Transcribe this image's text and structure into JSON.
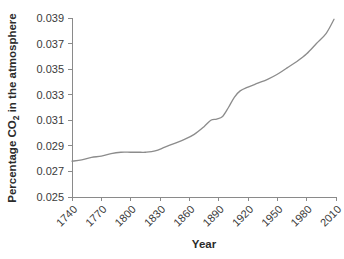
{
  "chart_data": {
    "type": "line",
    "title": "",
    "xlabel": "Year",
    "ylabel": "Percentage CO2 in the atmosphere",
    "ylabel_parts": {
      "prefix": "Percentage CO",
      "subscript": "2",
      "suffix": " in the atmosphere"
    },
    "xlim": [
      1740,
      2010
    ],
    "ylim": [
      0.025,
      0.039
    ],
    "xticks": [
      1740,
      1770,
      1800,
      1830,
      1860,
      1890,
      1920,
      1950,
      1980,
      2010
    ],
    "xtick_labels": [
      "1740",
      "1770",
      "1800",
      "1830",
      "1860",
      "1890",
      "1920",
      "1950",
      "1980",
      "2010"
    ],
    "yticks": [
      0.025,
      0.027,
      0.029,
      0.031,
      0.033,
      0.035,
      0.037,
      0.039
    ],
    "ytick_labels": [
      "0.025",
      "0.027",
      "0.029",
      "0.031",
      "0.033",
      "0.035",
      "0.037",
      "0.039"
    ],
    "grid": false,
    "legend": false,
    "xtick_label_rotation": -45,
    "line_color": "#8c8c8c",
    "axis_color": "#8a8a8a",
    "series": [
      {
        "name": "Atmospheric CO2",
        "x": [
          1740,
          1750,
          1760,
          1770,
          1780,
          1790,
          1800,
          1810,
          1815,
          1825,
          1835,
          1845,
          1855,
          1865,
          1875,
          1882,
          1888,
          1894,
          1900,
          1906,
          1912,
          1920,
          1930,
          1940,
          1950,
          1960,
          1970,
          1980,
          1990,
          2000,
          2008
        ],
        "y": [
          0.0278,
          0.0279,
          0.0281,
          0.0282,
          0.0284,
          0.0285,
          0.0285,
          0.0285,
          0.0285,
          0.0286,
          0.0289,
          0.0292,
          0.0295,
          0.0299,
          0.0305,
          0.031,
          0.0311,
          0.0313,
          0.032,
          0.0328,
          0.0333,
          0.0336,
          0.0339,
          0.0342,
          0.0346,
          0.0351,
          0.0356,
          0.0362,
          0.037,
          0.0378,
          0.0389
        ]
      }
    ]
  },
  "layout": {
    "plot_left": 72,
    "plot_right": 336,
    "plot_top": 18,
    "plot_bottom": 197
  }
}
